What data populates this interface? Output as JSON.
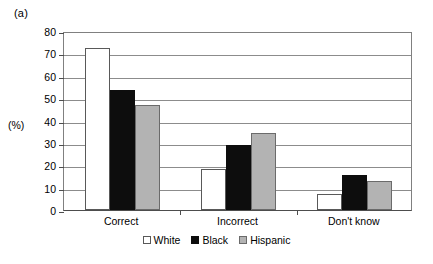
{
  "panel_label": "(a)",
  "y_axis_unit": "(%)",
  "chart_data": {
    "type": "bar",
    "title": "(a)",
    "xlabel": "",
    "ylabel": "(%)",
    "ylim": [
      0,
      80
    ],
    "yticks": [
      0,
      10,
      20,
      30,
      40,
      50,
      60,
      70,
      80
    ],
    "ytick_labels": [
      "0",
      "10",
      "20",
      "30",
      "40",
      "50",
      "60",
      "70",
      "80"
    ],
    "grid": true,
    "legend_position": "bottom-center",
    "categories": [
      "Correct",
      "Incorrect",
      "Don't know"
    ],
    "series": [
      {
        "name": "White",
        "color": "#ffffff",
        "values": [
          72.5,
          18.5,
          7.0
        ]
      },
      {
        "name": "Black",
        "color": "#0d0d0d",
        "values": [
          53.5,
          29.0,
          15.5
        ]
      },
      {
        "name": "Hispanic",
        "color": "#b3b3b3",
        "values": [
          47.0,
          34.5,
          13.0
        ]
      }
    ]
  }
}
